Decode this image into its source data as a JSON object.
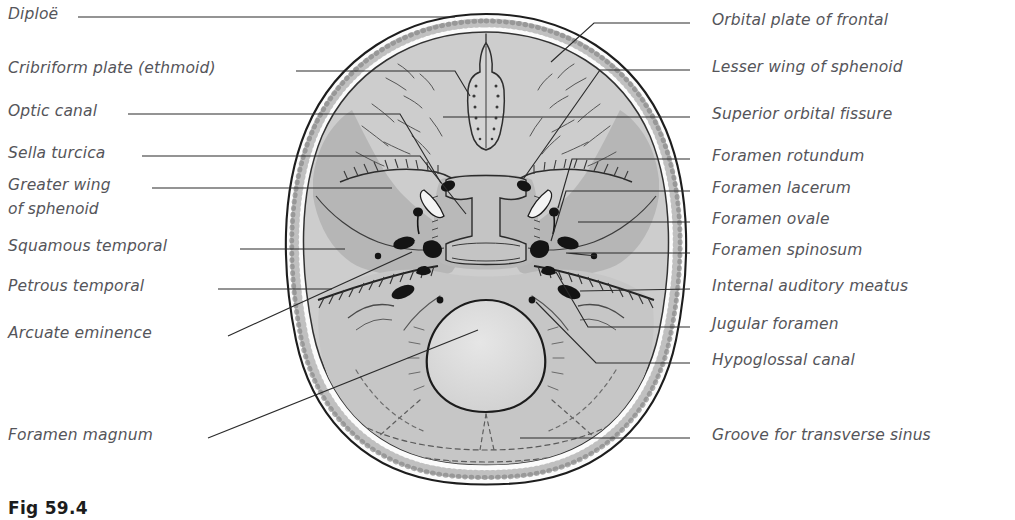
{
  "figure": {
    "caption": "Fig 59.4",
    "colors": {
      "text": "#55555a",
      "leader_line": "#2b2b2b",
      "outline": "#1e1e1e",
      "diploe_band": "#f2f2f2",
      "anterior_fossa_fill": "#cdcdcd",
      "middle_fossa_fill": "#b6b6b6",
      "posterior_fossa_fill": "#c6c6c6",
      "foramen_magnum_fill": "#d8d8d8",
      "foramen_black": "#161616",
      "background": "#ffffff"
    }
  },
  "labels_left": [
    {
      "id": "diploe",
      "text": "Diploë",
      "text2": "",
      "x": 8,
      "y": 6,
      "line_x1": 78,
      "line_y1": 17,
      "line_x2": 455,
      "line_y2": 17
    },
    {
      "id": "cribriform-plate",
      "text": "Cribriform plate (ethmoid)",
      "text2": "",
      "x": 8,
      "y": 60,
      "line_x1": 296,
      "line_y1": 71,
      "line_x2": 465,
      "line_y2": 97
    },
    {
      "id": "optic-canal",
      "text": "Optic canal",
      "text2": "",
      "x": 8,
      "y": 103,
      "line_x1": 128,
      "line_y1": 114,
      "line_x2": 432,
      "line_y2": 184
    },
    {
      "id": "sella-turcica",
      "text": "Sella turcica",
      "text2": "",
      "x": 8,
      "y": 145,
      "line_x1": 142,
      "line_y1": 156,
      "line_x2": 460,
      "line_y2": 212
    },
    {
      "id": "greater-wing",
      "text": "Greater wing",
      "text2": "of sphenoid",
      "x": 8,
      "y": 177,
      "line_x1": 152,
      "line_y1": 188,
      "line_x2": 392,
      "line_y2": 188
    },
    {
      "id": "squamous-temporal",
      "text": "Squamous temporal",
      "text2": "",
      "x": 8,
      "y": 238,
      "line_x1": 240,
      "line_y1": 249,
      "line_x2": 345,
      "line_y2": 249
    },
    {
      "id": "petrous-temporal",
      "text": "Petrous temporal",
      "text2": "",
      "x": 8,
      "y": 278,
      "line_x1": 218,
      "line_y1": 289,
      "line_x2": 330,
      "line_y2": 289
    },
    {
      "id": "arcuate-eminence",
      "text": "Arcuate eminence",
      "text2": "",
      "x": 8,
      "y": 325,
      "line_x1": 228,
      "line_y1": 336,
      "line_x2": 408,
      "line_y2": 253
    },
    {
      "id": "foramen-magnum",
      "text": "Foramen magnum",
      "text2": "",
      "x": 8,
      "y": 427,
      "line_x1": 208,
      "line_y1": 438,
      "line_x2": 475,
      "line_y2": 330
    }
  ],
  "labels_right": [
    {
      "id": "orbital-plate-of-frontal",
      "text": "Orbital plate of frontal",
      "x": 712,
      "y": 12,
      "dash_x": 692,
      "dash_y": 23,
      "line_x1": 690,
      "line_y1": 23,
      "line_x2": 590,
      "line_y2": 23,
      "line_x3": 551,
      "line_y3": 63
    },
    {
      "id": "lesser-wing-of-sphenoid",
      "text": "Lesser wing of sphenoid",
      "x": 712,
      "y": 59,
      "dash_x": 692,
      "dash_y": 70,
      "line_x1": 690,
      "line_y1": 70,
      "line_x2": 600,
      "line_y2": 70,
      "line_x3": 522,
      "line_y3": 180
    },
    {
      "id": "superior-orbital-fissure",
      "text": "Superior orbital fissure",
      "x": 712,
      "y": 106,
      "dash_x": 692,
      "dash_y": 117,
      "line_x1": 690,
      "line_y1": 117,
      "line_x2": 440,
      "line_y2": 117,
      "line_x3": 440,
      "line_y3": 117
    },
    {
      "id": "foramen-rotundum",
      "text": "Foramen rotundum",
      "x": 712,
      "y": 148,
      "dash_x": 692,
      "dash_y": 159,
      "line_x1": 690,
      "line_y1": 159,
      "line_x2": 569,
      "line_y2": 159,
      "line_x3": 536,
      "line_y3": 183
    },
    {
      "id": "foramen-lacerum",
      "text": "Foramen lacerum",
      "x": 712,
      "y": 180,
      "dash_x": 692,
      "dash_y": 191,
      "line_x1": 690,
      "line_y1": 191,
      "line_x2": 563,
      "line_y2": 191,
      "line_x3": 512,
      "line_y3": 213
    },
    {
      "id": "foramen-ovale",
      "text": "Foramen ovale",
      "x": 712,
      "y": 211,
      "dash_x": 692,
      "dash_y": 222,
      "line_x1": 690,
      "line_y1": 222,
      "line_x2": 565,
      "line_y2": 222,
      "line_x3": 546,
      "line_y3": 222
    },
    {
      "id": "foramen-spinosum",
      "text": "Foramen spinosum",
      "x": 712,
      "y": 242,
      "dash_x": 692,
      "dash_y": 253,
      "line_x1": 690,
      "line_y1": 253,
      "line_x2": 560,
      "line_y2": 253,
      "line_x3": 524,
      "line_y3": 237
    },
    {
      "id": "internal-auditory-meatus",
      "text": "Internal auditory meatus",
      "x": 712,
      "y": 278,
      "dash_x": 692,
      "dash_y": 289,
      "line_x1": 690,
      "line_y1": 289,
      "line_x2": 576,
      "line_y2": 289,
      "line_x3": 548,
      "line_y3": 289
    },
    {
      "id": "jugular-foramen",
      "text": "Jugular foramen",
      "x": 712,
      "y": 316,
      "dash_x": 692,
      "dash_y": 327,
      "line_x1": 690,
      "line_y1": 327,
      "line_x2": 583,
      "line_y2": 327,
      "line_x3": 549,
      "line_y3": 295
    },
    {
      "id": "hypoglossal-canal",
      "text": "Hypoglossal canal",
      "x": 712,
      "y": 352,
      "dash_x": 692,
      "dash_y": 363,
      "line_x1": 690,
      "line_y1": 363,
      "line_x2": 590,
      "line_y2": 363,
      "line_x3": 523,
      "line_y3": 292
    },
    {
      "id": "groove-for-transverse-sinus",
      "text": "Groove for transverse sinus",
      "x": 712,
      "y": 427,
      "dash_x": 692,
      "dash_y": 438,
      "line_x1": 690,
      "line_y1": 438,
      "line_x2": 523,
      "line_y2": 438,
      "line_x3": 523,
      "line_y3": 438
    }
  ]
}
